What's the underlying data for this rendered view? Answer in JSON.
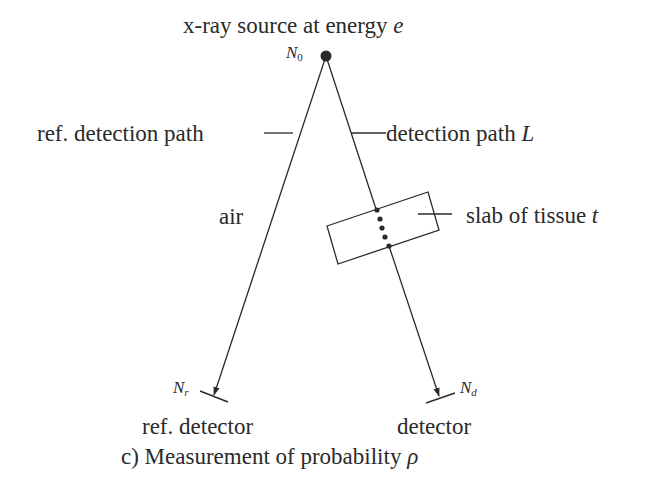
{
  "diagram": {
    "source_label": "x-ray source at energy",
    "source_var": "e",
    "source_count_symbol": "N",
    "source_count_sub": "0",
    "ref_path_label": "ref. detection path",
    "detection_path_label": "detection path",
    "detection_path_var": "L",
    "air_label": "air",
    "slab_label": "slab of tissue",
    "slab_var": "t",
    "ref_count_symbol": "N",
    "ref_count_sub": "r",
    "det_count_symbol": "N",
    "det_count_sub": "d",
    "ref_detector_label": "ref. detector",
    "detector_label": "detector",
    "caption_prefix": "c) Measurement of probability",
    "caption_var": "ρ"
  },
  "colors": {
    "stroke": "#2a2a2a",
    "background": "#ffffff"
  }
}
